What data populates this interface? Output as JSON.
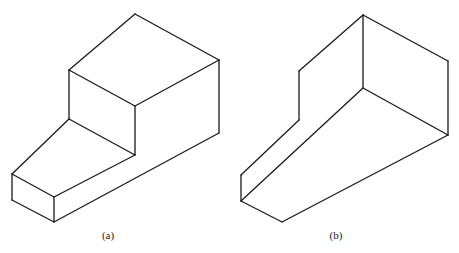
{
  "figures": [
    {
      "id": "a",
      "caption": "(a)",
      "description": "Isometric view of stepped block (top view)",
      "edges": [
        [
          135,
          14,
          219,
          60
        ],
        [
          219,
          60,
          219,
          133
        ],
        [
          135,
          14,
          69,
          70
        ],
        [
          69,
          70,
          135,
          106
        ],
        [
          135,
          106,
          219,
          60
        ],
        [
          69,
          70,
          69,
          119
        ],
        [
          135,
          106,
          135,
          155
        ],
        [
          69,
          119,
          135,
          155
        ],
        [
          69,
          119,
          12,
          174
        ],
        [
          12,
          174,
          54,
          197
        ],
        [
          54,
          197,
          135,
          155
        ],
        [
          12,
          174,
          12,
          200
        ],
        [
          54,
          197,
          54,
          222
        ],
        [
          12,
          200,
          54,
          222
        ],
        [
          54,
          222,
          219,
          133
        ]
      ]
    },
    {
      "id": "b",
      "caption": "(b)",
      "description": "Isometric view of stepped block (bottom view)",
      "edges": [
        [
          363,
          15,
          448,
          61
        ],
        [
          448,
          61,
          448,
          135
        ],
        [
          363,
          15,
          363,
          88
        ],
        [
          363,
          88,
          448,
          135
        ],
        [
          363,
          15,
          299,
          71
        ],
        [
          299,
          71,
          299,
          120
        ],
        [
          299,
          120,
          241,
          175
        ],
        [
          241,
          175,
          241,
          201
        ],
        [
          241,
          201,
          363,
          88
        ],
        [
          241,
          201,
          282,
          222
        ],
        [
          282,
          222,
          448,
          135
        ]
      ]
    }
  ],
  "colors": {
    "line": "#1a1a1a",
    "background": "#ffffff"
  }
}
